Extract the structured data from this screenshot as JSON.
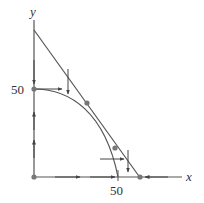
{
  "diagram": {
    "type": "phase-plane",
    "axes": {
      "x_label": "x",
      "y_label": "y",
      "x_tick_label": "50",
      "y_tick_label": "50"
    },
    "curves": [
      {
        "name": "straight-nullcline",
        "description": "line from y-axis (above 50) to x-axis (just past 50)"
      },
      {
        "name": "curved-nullcline",
        "description": "arc from (0,50) to (50,0)"
      }
    ],
    "equilibrium_points": [
      {
        "label": "origin",
        "approx": [
          0,
          0
        ]
      },
      {
        "label": "y-intercept",
        "approx": [
          0,
          50
        ]
      },
      {
        "label": "upper-intersection",
        "approx": [
          31,
          42
        ]
      },
      {
        "label": "lower-intersection",
        "approx": [
          50,
          17
        ]
      },
      {
        "label": "x-intercept",
        "approx": [
          63,
          0
        ]
      }
    ],
    "colors": {
      "line": "#555555",
      "point": "#777777",
      "background": "#ffffff"
    }
  }
}
